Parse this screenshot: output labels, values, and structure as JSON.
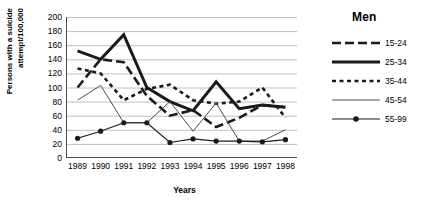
{
  "chart_data": {
    "type": "line",
    "title": "",
    "xlabel": "Years",
    "ylabel": "Persons with a suicide attempt/100,000",
    "ylabel_line1": "Persons with a suicide",
    "ylabel_line2": "attempt/100,000",
    "legend_title": "Men",
    "legend_position": "right",
    "grid": true,
    "categories": [
      "1989",
      "1990",
      "1991",
      "1992",
      "1993",
      "1994",
      "1995",
      "1996",
      "1997",
      "1998"
    ],
    "xticklabels": [
      "1989",
      "1990",
      "1991",
      "1992",
      "1993",
      "1994",
      "1995",
      "1996",
      "1997",
      "1998"
    ],
    "yticklabels": [
      "200",
      "180",
      "160",
      "140",
      "120",
      "100",
      "80",
      "60",
      "40",
      "20",
      "0"
    ],
    "ylim": [
      0,
      200
    ],
    "ytick_step": 20,
    "series": [
      {
        "name": "15-24",
        "style": "long-dash",
        "color": "#1a1a1a",
        "width": 2.6,
        "marker": "none",
        "values": [
          100,
          140,
          136,
          88,
          60,
          68,
          44,
          57,
          75,
          72
        ]
      },
      {
        "name": "25-34",
        "style": "solid",
        "color": "#1a1a1a",
        "width": 3.0,
        "marker": "none",
        "values": [
          152,
          140,
          175,
          100,
          80,
          67,
          108,
          70,
          75,
          72
        ]
      },
      {
        "name": "35-44",
        "style": "short-dash",
        "color": "#1a1a1a",
        "width": 2.6,
        "marker": "none",
        "values": [
          127,
          120,
          82,
          98,
          104,
          82,
          77,
          80,
          100,
          57
        ]
      },
      {
        "name": "45-54",
        "style": "thin-solid",
        "color": "#4d4d4d",
        "width": 1.0,
        "marker": "none",
        "values": [
          82,
          103,
          50,
          50,
          80,
          38,
          78,
          24,
          24,
          40
        ]
      },
      {
        "name": "55-99",
        "style": "solid-marker",
        "color": "#1a1a1a",
        "width": 1.2,
        "marker": "circle",
        "values": [
          28,
          38,
          50,
          50,
          22,
          27,
          24,
          24,
          23,
          26
        ]
      }
    ]
  }
}
